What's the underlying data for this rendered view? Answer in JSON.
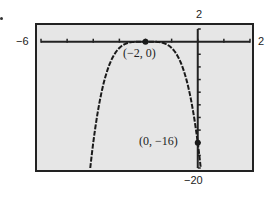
{
  "chart_data": {
    "type": "line",
    "title": "",
    "function": "y = -(x + 2)^4",
    "xlabel": "",
    "ylabel": "",
    "xlim": [
      -6,
      2
    ],
    "ylim": [
      -20,
      2
    ],
    "x_tick_step": 1,
    "y_tick_step": 2,
    "grid": false,
    "window_labels": {
      "xmin": "−6",
      "xmax": "2",
      "ymax": "2",
      "ymin": "−20"
    },
    "annotations": [
      {
        "label": "(−2, 0)",
        "x": -2,
        "y": 0
      },
      {
        "label": "(0, −16)",
        "x": 0,
        "y": -16
      }
    ],
    "series": [
      {
        "name": "y = -(x+2)^4",
        "x": [
          -4.11,
          -4,
          -3.5,
          -3,
          -2.5,
          -2,
          -1.5,
          -1,
          -0.5,
          0,
          0.11
        ],
        "values": [
          -20,
          -16,
          -5.06,
          -1,
          -0.06,
          0,
          -0.06,
          -1,
          -5.06,
          -16,
          -20
        ]
      }
    ]
  },
  "colors": {
    "plot_background": "#e6e6e6",
    "frame": "#222222",
    "curve": "#1a1a1a"
  }
}
